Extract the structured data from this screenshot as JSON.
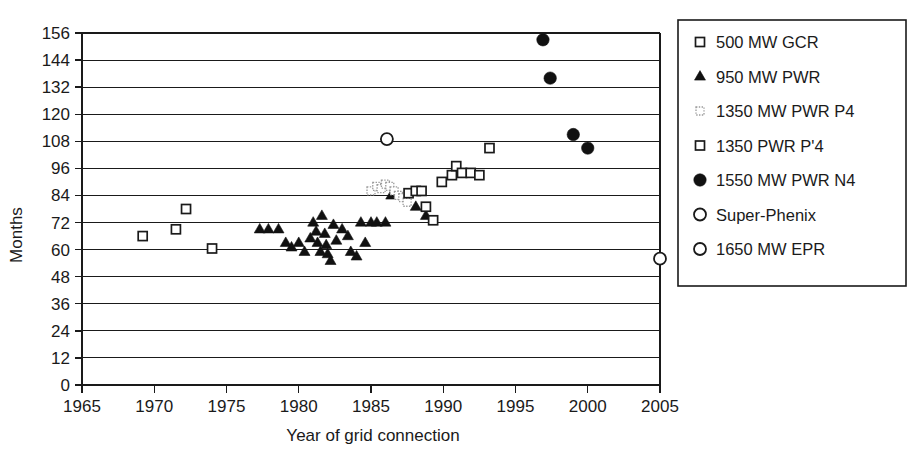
{
  "chart_data": {
    "type": "scatter",
    "title": "",
    "xlabel": "Year of grid connection",
    "ylabel": "Months",
    "xlim": [
      1965,
      2005
    ],
    "ylim": [
      0,
      156
    ],
    "xticks": [
      1965,
      1970,
      1975,
      1980,
      1985,
      1990,
      1995,
      2000,
      2005
    ],
    "yticks": [
      0,
      12,
      24,
      36,
      48,
      60,
      72,
      84,
      96,
      108,
      120,
      132,
      144,
      156
    ],
    "grid": "horizontal",
    "legend_position": "right",
    "series": [
      {
        "name": "500 MW GCR",
        "marker": "open-square",
        "points": [
          [
            1969.2,
            66
          ],
          [
            1971.5,
            69
          ],
          [
            1972.2,
            78
          ],
          [
            1974.0,
            60.5
          ]
        ]
      },
      {
        "name": "950 MW PWR",
        "marker": "filled-triangle",
        "points": [
          [
            1977.3,
            69
          ],
          [
            1977.9,
            69
          ],
          [
            1978.6,
            69
          ],
          [
            1979.1,
            63
          ],
          [
            1979.5,
            61
          ],
          [
            1980.0,
            63
          ],
          [
            1980.4,
            59
          ],
          [
            1980.8,
            65
          ],
          [
            1981.0,
            72
          ],
          [
            1981.2,
            68
          ],
          [
            1981.3,
            63
          ],
          [
            1981.5,
            59
          ],
          [
            1981.6,
            75
          ],
          [
            1981.8,
            67
          ],
          [
            1981.9,
            62
          ],
          [
            1982.0,
            58
          ],
          [
            1982.2,
            55
          ],
          [
            1982.4,
            71
          ],
          [
            1982.6,
            64
          ],
          [
            1983.0,
            69
          ],
          [
            1983.4,
            66
          ],
          [
            1983.6,
            59
          ],
          [
            1984.0,
            57
          ],
          [
            1984.3,
            72
          ],
          [
            1984.6,
            63
          ],
          [
            1985.0,
            72
          ],
          [
            1985.4,
            72
          ],
          [
            1986.0,
            72
          ],
          [
            1986.4,
            84
          ],
          [
            1988.1,
            79
          ],
          [
            1988.8,
            75
          ]
        ]
      },
      {
        "name": "1350 MW PWR P4",
        "marker": "dotted-square",
        "points": [
          [
            1985.0,
            86
          ],
          [
            1985.4,
            88
          ],
          [
            1985.7,
            87
          ],
          [
            1986.0,
            89
          ],
          [
            1986.3,
            88
          ],
          [
            1986.6,
            86
          ],
          [
            1986.9,
            84
          ],
          [
            1987.2,
            83
          ],
          [
            1987.5,
            81
          ]
        ]
      },
      {
        "name": "1350 PWR P'4",
        "marker": "open-square",
        "points": [
          [
            1987.6,
            85
          ],
          [
            1988.1,
            86
          ],
          [
            1988.5,
            86
          ],
          [
            1988.8,
            79
          ],
          [
            1989.3,
            73
          ],
          [
            1989.9,
            90
          ],
          [
            1990.6,
            93
          ],
          [
            1990.9,
            97
          ],
          [
            1991.3,
            94
          ],
          [
            1991.9,
            94
          ],
          [
            1992.5,
            93
          ],
          [
            1993.2,
            105
          ]
        ]
      },
      {
        "name": "1550 MW PWR N4",
        "marker": "filled-circle",
        "points": [
          [
            1996.9,
            153
          ],
          [
            1997.4,
            136
          ],
          [
            1999.0,
            111
          ],
          [
            2000.0,
            105
          ]
        ]
      },
      {
        "name": "Super-Phenix",
        "marker": "open-circle",
        "points": [
          [
            1986.1,
            109
          ]
        ]
      },
      {
        "name": "1650 MW EPR",
        "marker": "open-circle",
        "points": [
          [
            2005.0,
            56
          ]
        ]
      }
    ]
  },
  "legend": {
    "items": [
      {
        "label": "500 MW GCR",
        "marker": "open-square"
      },
      {
        "label": "950 MW PWR",
        "marker": "filled-triangle"
      },
      {
        "label": "1350 MW PWR P4",
        "marker": "dotted-square"
      },
      {
        "label": "1350 PWR P'4",
        "marker": "open-square"
      },
      {
        "label": "1550 MW PWR N4",
        "marker": "filled-circle"
      },
      {
        "label": "Super-Phenix",
        "marker": "open-circle"
      },
      {
        "label": "1650 MW EPR",
        "marker": "open-circle"
      }
    ]
  },
  "colors": {
    "ink": "#1a1a1a",
    "marker_fill": "#111111",
    "faint": "#9a9a9a",
    "background": "#ffffff"
  }
}
